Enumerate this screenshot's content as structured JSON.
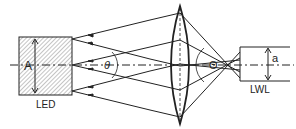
{
  "diagram": {
    "labels": {
      "source_dimension": "A",
      "source_name": "LED",
      "source_angle": "θ",
      "fiber_angle": "Θ",
      "fiber_dimension": "a",
      "fiber_name": "LWL"
    },
    "colors": {
      "stroke": "#222222",
      "hatch": "#9a9a9a",
      "background": "#ffffff"
    }
  }
}
